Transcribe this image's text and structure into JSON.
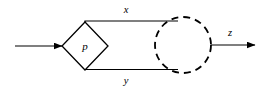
{
  "diagram": {
    "type": "flow-diagram",
    "background_color": "#ffffff",
    "stroke_color": "#000000",
    "nodes": [
      {
        "id": "decision",
        "shape": "diamond",
        "label": "p",
        "center_x": 85,
        "center_y": 46,
        "half_width": 23,
        "half_height": 24,
        "line_style": "solid"
      },
      {
        "id": "circle",
        "shape": "circle",
        "label": "",
        "center_x": 183,
        "center_y": 45,
        "radius": 28,
        "line_style": "dashed"
      }
    ],
    "edges": [
      {
        "id": "input",
        "label": "",
        "arrowhead": true,
        "line_style": "solid"
      },
      {
        "id": "upper-branch",
        "label": "x",
        "arrowhead": false,
        "line_style": "solid"
      },
      {
        "id": "lower-branch",
        "label": "y",
        "arrowhead": false,
        "line_style": "solid"
      },
      {
        "id": "output",
        "label": "z",
        "arrowhead": true,
        "line_style": "solid"
      }
    ]
  },
  "labels": {
    "node_p": "p",
    "edge_x": "x",
    "edge_y": "y",
    "edge_z": "z"
  }
}
